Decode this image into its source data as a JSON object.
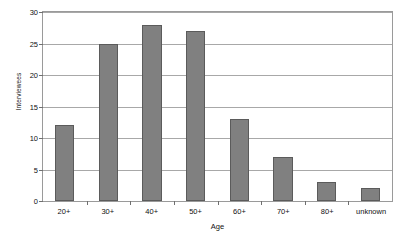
{
  "chart_data": {
    "type": "bar",
    "title": "",
    "xlabel": "Age",
    "ylabel": "Interviewees",
    "categories": [
      "20+",
      "30+",
      "40+",
      "50+",
      "60+",
      "70+",
      "80+",
      "unknown"
    ],
    "values": [
      12,
      25,
      28,
      27,
      13,
      7,
      3,
      2
    ],
    "ylim": [
      0,
      30
    ],
    "yticks": [
      0,
      5,
      10,
      15,
      20,
      25,
      30
    ],
    "ytick_labels": [
      "0",
      "5",
      "10",
      "15",
      "20",
      "25",
      "30"
    ],
    "grid": true,
    "grid_axis": "y",
    "legend": false,
    "bar_color": "#808080",
    "bar_edge_color": "#5b5b5b",
    "gridline_color": "#a8a8a8",
    "frame_color": "#9a9a9a",
    "background_color": "#ffffff"
  }
}
